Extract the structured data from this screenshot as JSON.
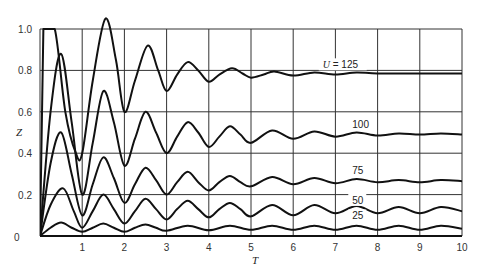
{
  "chart_data": {
    "type": "line",
    "title": "",
    "xlabel": "T",
    "ylabel": "Z",
    "xlim": [
      0,
      10
    ],
    "ylim": [
      0,
      1.0
    ],
    "x_ticks": [
      "1",
      "2",
      "3",
      "4",
      "5",
      "6",
      "7",
      "8",
      "9",
      "10"
    ],
    "y_ticks": [
      "0",
      "0.2",
      "0.4",
      "0.6",
      "0.8",
      "1.0"
    ],
    "origin_label": "0",
    "grid": true,
    "legend_position": "inline labels at right",
    "series": [
      {
        "name": "U = 125",
        "label": "U = 125",
        "points": [
          [
            0,
            0
          ],
          [
            0.08,
            1.0
          ],
          [
            0.35,
            1.0
          ],
          [
            0.6,
            0.6
          ],
          [
            0.85,
            0.4
          ],
          [
            1.0,
            0.4
          ],
          [
            1.25,
            0.75
          ],
          [
            1.55,
            1.05
          ],
          [
            1.8,
            0.85
          ],
          [
            2.0,
            0.6
          ],
          [
            2.25,
            0.75
          ],
          [
            2.55,
            0.92
          ],
          [
            2.8,
            0.8
          ],
          [
            3.0,
            0.7
          ],
          [
            3.25,
            0.78
          ],
          [
            3.5,
            0.84
          ],
          [
            3.75,
            0.8
          ],
          [
            4.0,
            0.745
          ],
          [
            4.25,
            0.78
          ],
          [
            4.55,
            0.81
          ],
          [
            4.8,
            0.785
          ],
          [
            5.0,
            0.765
          ],
          [
            5.3,
            0.78
          ],
          [
            5.55,
            0.795
          ],
          [
            6.0,
            0.775
          ],
          [
            6.5,
            0.79
          ],
          [
            7.0,
            0.78
          ],
          [
            7.5,
            0.79
          ],
          [
            8.0,
            0.785
          ],
          [
            9.0,
            0.785
          ],
          [
            10.0,
            0.785
          ]
        ]
      },
      {
        "name": "U = 100",
        "label": "100",
        "points": [
          [
            0,
            0
          ],
          [
            0.25,
            0.6
          ],
          [
            0.5,
            0.88
          ],
          [
            0.75,
            0.55
          ],
          [
            1.0,
            0.2
          ],
          [
            1.25,
            0.45
          ],
          [
            1.5,
            0.7
          ],
          [
            1.75,
            0.55
          ],
          [
            2.0,
            0.34
          ],
          [
            2.25,
            0.47
          ],
          [
            2.5,
            0.6
          ],
          [
            2.75,
            0.5
          ],
          [
            3.0,
            0.4
          ],
          [
            3.25,
            0.48
          ],
          [
            3.5,
            0.55
          ],
          [
            3.75,
            0.5
          ],
          [
            4.0,
            0.43
          ],
          [
            4.25,
            0.48
          ],
          [
            4.5,
            0.53
          ],
          [
            4.75,
            0.49
          ],
          [
            5.0,
            0.45
          ],
          [
            5.5,
            0.51
          ],
          [
            6.0,
            0.47
          ],
          [
            6.5,
            0.505
          ],
          [
            7.0,
            0.48
          ],
          [
            7.5,
            0.5
          ],
          [
            8.0,
            0.485
          ],
          [
            8.5,
            0.495
          ],
          [
            9.0,
            0.49
          ],
          [
            9.5,
            0.495
          ],
          [
            10.0,
            0.49
          ]
        ]
      },
      {
        "name": "U = 75",
        "label": "75",
        "points": [
          [
            0,
            0
          ],
          [
            0.25,
            0.35
          ],
          [
            0.5,
            0.5
          ],
          [
            0.75,
            0.3
          ],
          [
            1.0,
            0.1
          ],
          [
            1.25,
            0.25
          ],
          [
            1.5,
            0.38
          ],
          [
            1.75,
            0.28
          ],
          [
            2.0,
            0.16
          ],
          [
            2.25,
            0.25
          ],
          [
            2.5,
            0.33
          ],
          [
            2.75,
            0.27
          ],
          [
            3.0,
            0.2
          ],
          [
            3.25,
            0.26
          ],
          [
            3.5,
            0.31
          ],
          [
            3.75,
            0.26
          ],
          [
            4.0,
            0.22
          ],
          [
            4.25,
            0.26
          ],
          [
            4.5,
            0.29
          ],
          [
            4.75,
            0.26
          ],
          [
            5.0,
            0.24
          ],
          [
            5.5,
            0.285
          ],
          [
            6.0,
            0.25
          ],
          [
            6.5,
            0.28
          ],
          [
            7.0,
            0.255
          ],
          [
            7.5,
            0.275
          ],
          [
            8.0,
            0.26
          ],
          [
            8.5,
            0.27
          ],
          [
            9.0,
            0.26
          ],
          [
            9.5,
            0.27
          ],
          [
            10.0,
            0.265
          ]
        ]
      },
      {
        "name": "U = 50",
        "label": "50",
        "points": [
          [
            0,
            0
          ],
          [
            0.25,
            0.15
          ],
          [
            0.55,
            0.23
          ],
          [
            0.8,
            0.12
          ],
          [
            1.0,
            0.04
          ],
          [
            1.25,
            0.12
          ],
          [
            1.5,
            0.2
          ],
          [
            1.75,
            0.13
          ],
          [
            2.0,
            0.06
          ],
          [
            2.25,
            0.12
          ],
          [
            2.5,
            0.18
          ],
          [
            2.75,
            0.13
          ],
          [
            3.0,
            0.08
          ],
          [
            3.25,
            0.13
          ],
          [
            3.5,
            0.17
          ],
          [
            3.75,
            0.13
          ],
          [
            4.0,
            0.09
          ],
          [
            4.25,
            0.13
          ],
          [
            4.5,
            0.16
          ],
          [
            4.75,
            0.13
          ],
          [
            5.0,
            0.095
          ],
          [
            5.5,
            0.15
          ],
          [
            6.0,
            0.1
          ],
          [
            6.5,
            0.15
          ],
          [
            7.0,
            0.11
          ],
          [
            7.5,
            0.145
          ],
          [
            8.0,
            0.11
          ],
          [
            8.5,
            0.14
          ],
          [
            9.0,
            0.11
          ],
          [
            9.5,
            0.14
          ],
          [
            10.0,
            0.12
          ]
        ]
      },
      {
        "name": "U = 25",
        "label": "25",
        "points": [
          [
            0,
            0
          ],
          [
            0.25,
            0.04
          ],
          [
            0.5,
            0.065
          ],
          [
            0.75,
            0.04
          ],
          [
            1.0,
            0.02
          ],
          [
            1.25,
            0.04
          ],
          [
            1.5,
            0.06
          ],
          [
            1.75,
            0.04
          ],
          [
            2.0,
            0.02
          ],
          [
            2.25,
            0.04
          ],
          [
            2.5,
            0.055
          ],
          [
            2.75,
            0.04
          ],
          [
            3.0,
            0.025
          ],
          [
            3.5,
            0.05
          ],
          [
            4.0,
            0.028
          ],
          [
            4.5,
            0.05
          ],
          [
            5.0,
            0.03
          ],
          [
            5.5,
            0.05
          ],
          [
            6.0,
            0.03
          ],
          [
            6.5,
            0.05
          ],
          [
            7.0,
            0.03
          ],
          [
            7.5,
            0.05
          ],
          [
            8.0,
            0.03
          ],
          [
            8.5,
            0.05
          ],
          [
            9.0,
            0.03
          ],
          [
            9.5,
            0.05
          ],
          [
            10.0,
            0.035
          ]
        ]
      }
    ],
    "annotations": [
      {
        "text": "U = 125",
        "t": 6.7,
        "z": 0.81
      },
      {
        "text": "100",
        "t": 7.4,
        "z": 0.52
      },
      {
        "text": "75",
        "t": 7.4,
        "z": 0.3
      },
      {
        "text": "50",
        "t": 7.4,
        "z": 0.155
      },
      {
        "text": "25",
        "t": 7.4,
        "z": 0.08
      }
    ]
  }
}
